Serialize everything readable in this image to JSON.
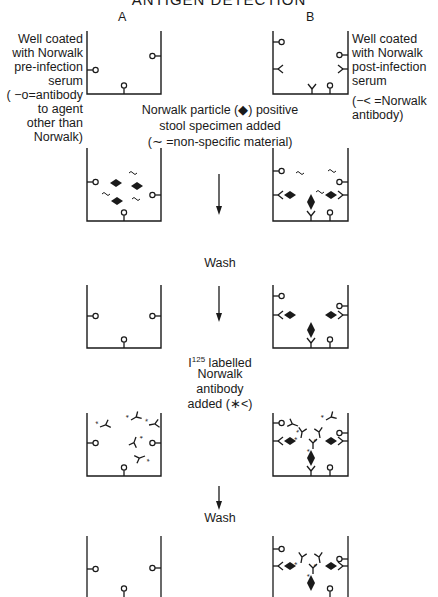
{
  "title": "ANTIGEN DETECTION",
  "columns": {
    "a": "A",
    "b": "B"
  },
  "left_label": {
    "lines": [
      "Well coated",
      "with Norwalk",
      "pre-infection",
      "serum",
      "( −o=antibody",
      "to agent",
      "other than",
      "Norwalk)"
    ]
  },
  "right_label": {
    "lines": [
      "Well coated",
      "with Norwalk",
      "post-infection",
      "serum",
      "(−< =Norwalk",
      "antibody)"
    ]
  },
  "steps": {
    "specimen": [
      "Norwalk particle (◆) positive",
      "stool specimen added",
      "(∼ =non-specific material)"
    ],
    "wash1": "Wash",
    "iodine_prefix": "I",
    "iodine_sup": "125",
    "iodine": [
      " labelled",
      "Norwalk",
      "antibody",
      "added (∗<)"
    ],
    "wash2": "Wash"
  },
  "legend_symbols": {
    "control_antibody": "antibody to agent other than Norwalk (stick with open circle)",
    "norwalk_antibody": "Norwalk antibody (fork)",
    "norwalk_particle": "filled diamond",
    "nonspecific": "tilde",
    "labelled_antibody": "fork with asterisk"
  },
  "colors": {
    "ink": "#1a1a1a",
    "background": "#ffffff"
  }
}
